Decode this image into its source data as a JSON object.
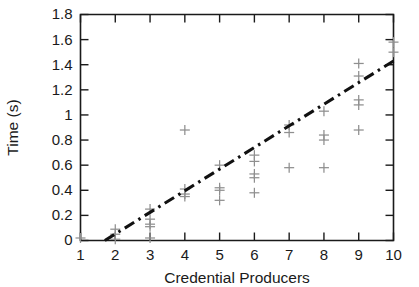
{
  "chart_data": {
    "type": "scatter",
    "title": "",
    "xlabel": "Credential Producers",
    "ylabel": "Time (s)",
    "xlim": [
      1,
      10
    ],
    "ylim": [
      0,
      1.8
    ],
    "xticks": [
      1,
      2,
      3,
      4,
      5,
      6,
      7,
      8,
      9,
      10
    ],
    "xticklabels": [
      "1",
      "2",
      "3",
      "4",
      "5",
      "6",
      "7",
      "8",
      "9",
      "10"
    ],
    "yticks": [
      0,
      0.2,
      0.4,
      0.6,
      0.8,
      1,
      1.2,
      1.4,
      1.6,
      1.8
    ],
    "yticklabels": [
      "0",
      "0.2",
      "0.4",
      "0.6",
      "0.8",
      "1",
      "1.2",
      "1.4",
      "1.6",
      "1.8"
    ],
    "grid": false,
    "legend": null,
    "marker_style": "plus",
    "marker_color": "#8f8f8f",
    "series": [
      {
        "name": "Measurements",
        "marker": "+",
        "points": [
          [
            1,
            0.02
          ],
          [
            2,
            0.05
          ],
          [
            2,
            0.09
          ],
          [
            2,
            0.01
          ],
          [
            3,
            0.25
          ],
          [
            3,
            0.17
          ],
          [
            3,
            0.13
          ],
          [
            3,
            0.11
          ],
          [
            3,
            0.02
          ],
          [
            4,
            0.88
          ],
          [
            4,
            0.41
          ],
          [
            4,
            0.37
          ],
          [
            4,
            0.35
          ],
          [
            5,
            0.6
          ],
          [
            5,
            0.42
          ],
          [
            5,
            0.4
          ],
          [
            5,
            0.32
          ],
          [
            6,
            0.68
          ],
          [
            6,
            0.63
          ],
          [
            6,
            0.53
          ],
          [
            6,
            0.5
          ],
          [
            6,
            0.38
          ],
          [
            7,
            0.92
          ],
          [
            7,
            0.86
          ],
          [
            7,
            0.58
          ],
          [
            8,
            1.03
          ],
          [
            8,
            0.84
          ],
          [
            8,
            0.8
          ],
          [
            8,
            0.58
          ],
          [
            9,
            1.41
          ],
          [
            9,
            1.31
          ],
          [
            9,
            1.12
          ],
          [
            9,
            1.08
          ],
          [
            9,
            0.88
          ],
          [
            10,
            1.58
          ],
          [
            10,
            1.5
          ]
        ]
      }
    ],
    "fit_line": {
      "style": "dash-dot",
      "color": "#111111",
      "x_start": 1.7,
      "y_start": 0.0,
      "x_end": 10.0,
      "y_end": 1.43
    }
  }
}
